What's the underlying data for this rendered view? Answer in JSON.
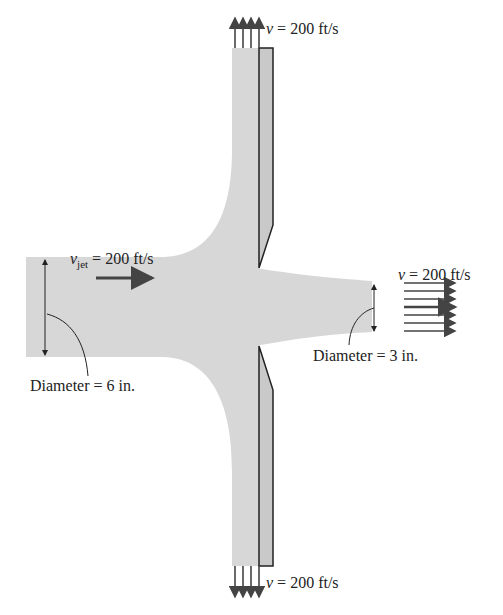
{
  "figure": {
    "colors": {
      "fluid": "#d7d7d7",
      "plate_fill": "#c9c9c9",
      "outline": "#222222",
      "arrow": "#444444"
    }
  },
  "labels": {
    "top_velocity": {
      "symbol": "v",
      "text": " = 200 ft/s"
    },
    "bottom_velocity": {
      "symbol": "v",
      "text": " = 200 ft/s"
    },
    "jet_velocity": {
      "symbol": "v",
      "subscript": "jet",
      "text": " = 200 ft/s"
    },
    "exit_velocity": {
      "symbol": "v",
      "text": " = 200 ft/s"
    },
    "inlet_diameter": "Diameter = 6 in.",
    "exit_diameter": "Diameter = 3 in."
  }
}
